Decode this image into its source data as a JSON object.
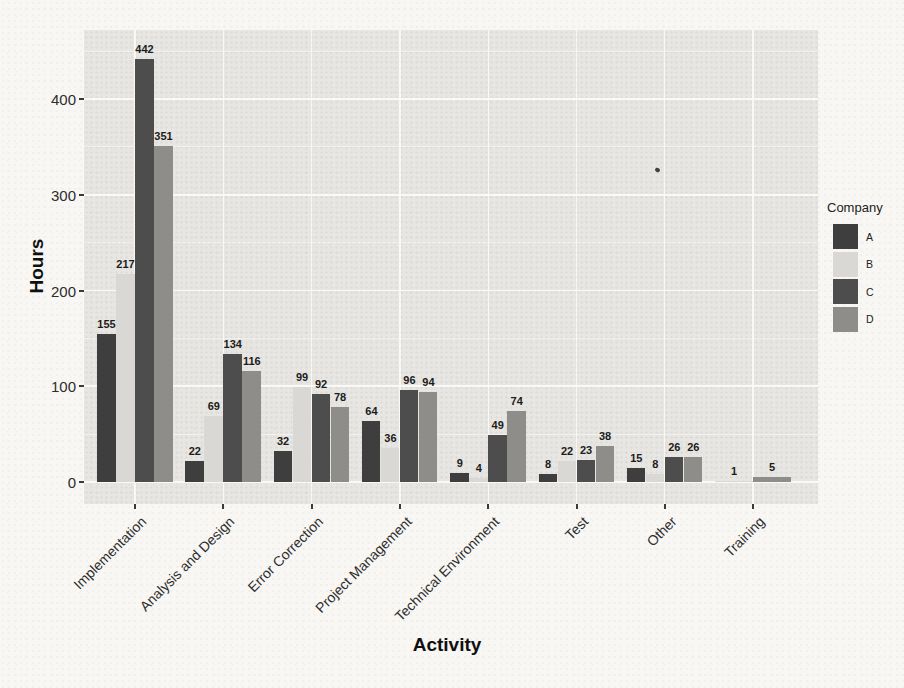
{
  "legend": {
    "title": "Company",
    "position": "right"
  },
  "colors": {
    "paper": "#f8f7f4",
    "panel_bg": "#e7e6e2",
    "gridline": "#fbfaf8",
    "bar_label": "#1c1c1c",
    "series_a": "#3e3e3e",
    "series_b": "#d9d8d4",
    "series_c": "#4d4d4d",
    "series_d": "#8e8d89"
  },
  "chart_data": {
    "type": "bar",
    "grouping": "dodged",
    "title": "",
    "xlabel": "Activity",
    "ylabel": "Hours",
    "categories": [
      "Implementation",
      "Analysis and Design",
      "Error Correction",
      "Project Management",
      "Technical Environment",
      "Test",
      "Other",
      "Training"
    ],
    "series": [
      {
        "name": "A",
        "color": "#3e3e3e",
        "values": [
          155,
          22,
          32,
          64,
          9,
          8,
          15,
          null
        ]
      },
      {
        "name": "B",
        "color": "#d9d8d4",
        "values": [
          217,
          69,
          99,
          36,
          4,
          22,
          8,
          1
        ]
      },
      {
        "name": "C",
        "color": "#4d4d4d",
        "values": [
          442,
          134,
          92,
          96,
          49,
          23,
          26,
          null
        ]
      },
      {
        "name": "D",
        "color": "#8e8d89",
        "values": [
          351,
          116,
          78,
          94,
          74,
          38,
          26,
          5
        ]
      }
    ],
    "bar_value_labels": true,
    "ylim": [
      0,
      472
    ],
    "y_ticks": [
      0,
      100,
      200,
      300,
      400
    ],
    "y_minor_ticks": [
      50,
      150,
      250,
      350,
      450
    ],
    "grid": true,
    "legend_position": "right",
    "panel_background": "gray",
    "x_label_rotation_deg": -45
  }
}
